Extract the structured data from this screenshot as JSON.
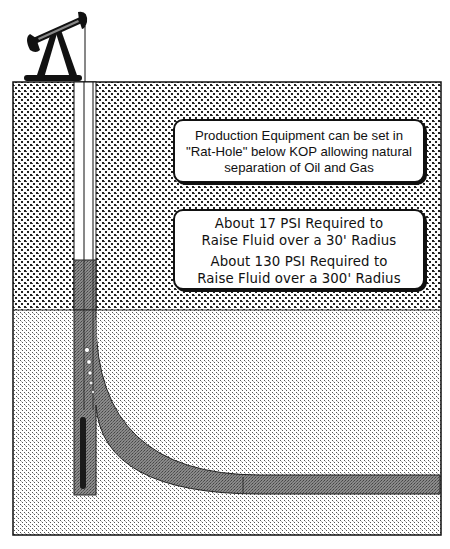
{
  "diagram": {
    "colors": {
      "outline": "#111111",
      "casing": "#7a7a7a",
      "casing_dark": "#4a4a4a",
      "upper_formation_bg": "#ffffff",
      "upper_formation_dot": "#222222",
      "lower_formation_bg": "#ffffff",
      "lower_formation_dot": "#555555",
      "tubing": "#1a1a1a"
    },
    "components": {
      "surface": "pumpjack",
      "upper_formation": "coarse stipple",
      "lower_formation": "fine stipple",
      "wellbore": "vertical with rat-hole",
      "lateral": "curved build to horizontal"
    }
  },
  "callouts": [
    {
      "lines": [
        "Production Equipment can be set in",
        "\"Rat-Hole\" below KOP allowing natural",
        "separation of Oil and Gas"
      ]
    },
    {
      "groups": [
        [
          "About 17 PSI Required to",
          "Raise Fluid over a 30' Radius"
        ],
        [
          "About 130 PSI Required to",
          "Raise Fluid over a 300' Radius"
        ]
      ]
    }
  ]
}
